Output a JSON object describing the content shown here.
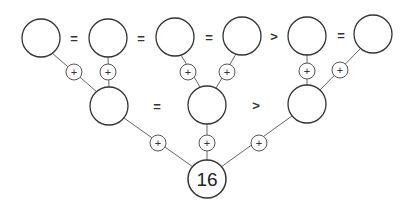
{
  "puzzle": {
    "result_value": "16",
    "plus_symbol": "+",
    "colors": {
      "stroke": "#333333",
      "edge": "#666666",
      "text": "#222222",
      "background": "#ffffff"
    },
    "top_row": {
      "nodes": [
        {
          "id": "t1",
          "value": ""
        },
        {
          "id": "t2",
          "value": ""
        },
        {
          "id": "t3",
          "value": ""
        },
        {
          "id": "t4",
          "value": ""
        },
        {
          "id": "t5",
          "value": ""
        },
        {
          "id": "t6",
          "value": ""
        }
      ],
      "operators": [
        "=",
        "=",
        "=",
        ">",
        "="
      ]
    },
    "middle_row": {
      "nodes": [
        {
          "id": "m1",
          "value": ""
        },
        {
          "id": "m2",
          "value": ""
        },
        {
          "id": "m3",
          "value": ""
        }
      ],
      "operators": [
        "=",
        ">"
      ]
    },
    "bottom": {
      "node": {
        "id": "b1",
        "value": "16"
      }
    }
  }
}
